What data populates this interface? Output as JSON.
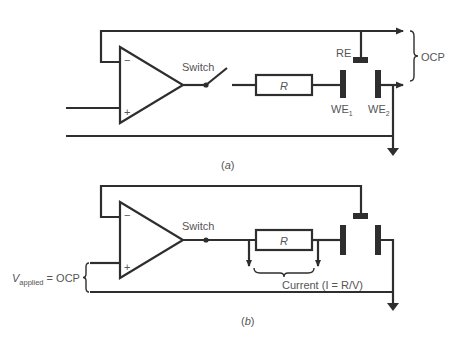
{
  "diagram": {
    "colors": {
      "wire": "#2e2e2e",
      "label": "#555555",
      "background": "#ffffff"
    },
    "panel_a": {
      "caption": "(a)",
      "caption_letter": "a",
      "switch_label": "Switch",
      "resistor_label": "R",
      "reference_electrode_label": "RE",
      "working_electrode_1_label": "WE",
      "working_electrode_1_sub": "1",
      "working_electrode_2_label": "WE",
      "working_electrode_2_sub": "2",
      "measurement_label": "OCP",
      "opamp_minus": "−",
      "opamp_plus": "+",
      "switch_state": "open"
    },
    "panel_b": {
      "caption_letter": "b",
      "switch_label": "Switch",
      "resistor_label": "R",
      "applied_voltage_symbol": "V",
      "applied_voltage_sub": "applied",
      "applied_voltage_eq": " = OCP",
      "current_label": "Current (I = R/V)",
      "opamp_minus": "−",
      "opamp_plus": "+",
      "switch_state": "closed"
    }
  }
}
